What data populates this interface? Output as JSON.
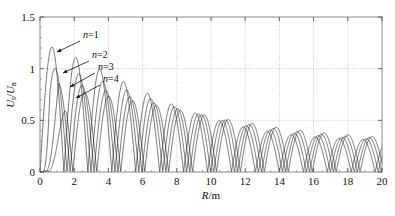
{
  "figure": {
    "name": "normalized-voltage-vs-radius-plot",
    "background": "#ffffff",
    "frame_color": "#8a8a8a",
    "grid_color": "#b9b9b9",
    "curve_color": "#1a1a1a"
  },
  "axes": {
    "x": {
      "label_var": "R",
      "label_sep": "/",
      "label_unit": "m",
      "label_full": "R/m",
      "min": 0,
      "max": 20,
      "ticks": [
        0,
        2,
        4,
        6,
        8,
        10,
        12,
        14,
        16,
        18,
        20
      ],
      "tick_labels": [
        "0",
        "2",
        "4",
        "6",
        "8",
        "10",
        "12",
        "14",
        "16",
        "18",
        "20"
      ],
      "minor_tick_step": 0.5
    },
    "y": {
      "label_num_var": "U",
      "label_num_sub": "s",
      "label_sep": "/",
      "label_den_var": "U",
      "label_den_sub": "n",
      "label_full": "Us/Un",
      "min": 0,
      "max": 1.5,
      "ticks": [
        0,
        0.5,
        1,
        1.5
      ],
      "tick_labels": [
        "0",
        "0.5",
        "1",
        "1.5"
      ],
      "minor_tick_step": 0.1
    }
  },
  "annotations": [
    {
      "name": "curve-label-n1",
      "text": "n=1",
      "var": "n",
      "rest": "=1",
      "tx": 83,
      "ty": 38,
      "ax1": 80,
      "ay1": 41,
      "ax2": 57,
      "ay2": 52
    },
    {
      "name": "curve-label-n2",
      "text": "n=2",
      "var": "n",
      "rest": "=2",
      "tx": 92,
      "ty": 58,
      "ax1": 89,
      "ay1": 61,
      "ax2": 63,
      "ay2": 73
    },
    {
      "name": "curve-label-n3",
      "text": "n=3",
      "var": "n",
      "rest": "=3",
      "tx": 98,
      "ty": 70,
      "ax1": 95,
      "ay1": 73,
      "ax2": 70,
      "ay2": 87
    },
    {
      "name": "curve-label-n4",
      "text": "n=4",
      "var": "n",
      "rest": "=4",
      "tx": 103,
      "ty": 82,
      "ax1": 100,
      "ay1": 85,
      "ax2": 76,
      "ay2": 98
    }
  ],
  "chart_data": {
    "type": "line",
    "title": "",
    "xlabel": "R/m",
    "ylabel": "Us/Un",
    "xlim": [
      0,
      20
    ],
    "ylim": [
      0,
      1.5
    ],
    "grid": true,
    "grid_x": [
      2,
      4,
      6,
      8,
      10,
      12,
      14,
      16,
      18
    ],
    "grid_y": [
      0.5,
      1.0
    ],
    "legend_position": "inline-annotations",
    "x_ticks": [
      0,
      2,
      4,
      6,
      8,
      10,
      12,
      14,
      16,
      18,
      20
    ],
    "y_ticks": [
      0,
      0.5,
      1,
      1.5
    ],
    "series": [
      {
        "name": "n=1",
        "first_peak_x": 0.72,
        "first_peak_y": 1.21,
        "half_period": 0.7,
        "envelope_start": 1.21,
        "envelope_end": 0.3,
        "envelope_decay": 0.075,
        "phase_offset": 0.0,
        "style": "solid"
      },
      {
        "name": "n=2",
        "first_peak_x": 1.28,
        "first_peak_y": 1.0,
        "half_period": 0.7,
        "envelope_start": 1.0,
        "envelope_end": 0.3,
        "envelope_decay": 0.065,
        "phase_offset": 0.18,
        "style": "solid"
      },
      {
        "name": "n=3",
        "first_peak_x": 1.78,
        "first_peak_y": 0.86,
        "half_period": 0.7,
        "envelope_start": 0.86,
        "envelope_end": 0.3,
        "envelope_decay": 0.055,
        "phase_offset": 0.36,
        "style": "solid"
      },
      {
        "name": "n=4",
        "first_peak_x": 2.25,
        "first_peak_y": 0.78,
        "half_period": 0.7,
        "envelope_start": 0.78,
        "envelope_end": 0.3,
        "envelope_decay": 0.048,
        "phase_offset": 0.52,
        "style": "solid"
      }
    ],
    "envelope_values": {
      "x": [
        0.7,
        1.5,
        2.5,
        4,
        6,
        8,
        10,
        12,
        14,
        16,
        18,
        20
      ],
      "n1": [
        1.21,
        0.95,
        0.72,
        0.56,
        0.47,
        0.42,
        0.39,
        0.36,
        0.34,
        0.33,
        0.31,
        0.3
      ],
      "n2": [
        1.0,
        1.0,
        0.8,
        0.6,
        0.49,
        0.43,
        0.4,
        0.37,
        0.35,
        0.33,
        0.32,
        0.3
      ],
      "n3": [
        0.86,
        0.86,
        0.86,
        0.64,
        0.51,
        0.44,
        0.4,
        0.38,
        0.35,
        0.34,
        0.32,
        0.3
      ],
      "n4": [
        0.78,
        0.78,
        0.78,
        0.68,
        0.53,
        0.45,
        0.41,
        0.38,
        0.36,
        0.34,
        0.32,
        0.3
      ]
    }
  }
}
